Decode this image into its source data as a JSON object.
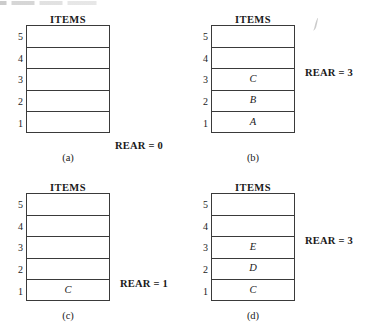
{
  "figure": {
    "column_header": "ITEMS",
    "row_indices": [
      "5",
      "4",
      "3",
      "2",
      "1"
    ],
    "panels": [
      {
        "id": "a",
        "caption": "(a)",
        "header": "ITEMS",
        "cells": [
          "",
          "",
          "",
          "",
          ""
        ],
        "rear_label": "REAR = 0",
        "rear_value": 0
      },
      {
        "id": "b",
        "caption": "(b)",
        "header": "ITEMS",
        "cells": [
          "",
          "",
          "C",
          "B",
          "A"
        ],
        "rear_label": "REAR = 3",
        "rear_value": 3
      },
      {
        "id": "c",
        "caption": "(c)",
        "header": "ITEMS",
        "cells": [
          "",
          "",
          "",
          "",
          "C"
        ],
        "rear_label": "REAR = 1",
        "rear_value": 1
      },
      {
        "id": "d",
        "caption": "(d)",
        "header": "ITEMS",
        "cells": [
          "",
          "",
          "E",
          "D",
          "C"
        ],
        "rear_label": "REAR = 3",
        "rear_value": 3
      }
    ]
  },
  "colors": {
    "ink": "#1a1a1a",
    "rule": "#3a3a3a",
    "background": "#ffffff"
  }
}
